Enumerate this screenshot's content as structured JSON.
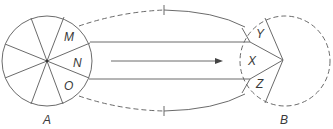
{
  "diagram": {
    "circle_a": {
      "label": "A",
      "sectors": [
        "M",
        "N",
        "O"
      ]
    },
    "circle_b": {
      "label": "B",
      "sectors": [
        "Y",
        "X",
        "Z"
      ]
    },
    "arrow_direction": "left-to-right",
    "colors": {
      "stroke": "#6b6b6b",
      "text": "#3a3a3a",
      "background": "#ffffff"
    }
  }
}
